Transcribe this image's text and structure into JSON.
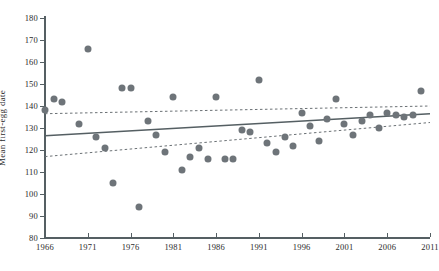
{
  "chart_data": {
    "type": "scatter",
    "title": "",
    "xlabel": "",
    "ylabel": "Mean first-egg date",
    "xlim": [
      1966,
      2011
    ],
    "ylim": [
      80,
      180
    ],
    "grid": false,
    "legend": "none",
    "xticks": [
      1966,
      1971,
      1976,
      1981,
      1986,
      1991,
      1996,
      2001,
      2006,
      2011
    ],
    "yticks": [
      80,
      90,
      100,
      110,
      120,
      130,
      140,
      150,
      160,
      170,
      180
    ],
    "point_color": "#6e7479",
    "line_color": "#555f63",
    "series": [
      {
        "name": "Mean first-egg date",
        "x": [
          1966,
          1967,
          1968,
          1970,
          1971,
          1972,
          1973,
          1974,
          1975,
          1976,
          1977,
          1978,
          1979,
          1980,
          1981,
          1982,
          1983,
          1984,
          1985,
          1986,
          1987,
          1988,
          1989,
          1990,
          1991,
          1992,
          1993,
          1994,
          1995,
          1996,
          1997,
          1998,
          1999,
          2000,
          2001,
          2002,
          2003,
          2004,
          2005,
          2006,
          2007,
          2008,
          2009,
          2010
        ],
        "y": [
          138,
          143,
          142,
          132,
          166,
          126,
          121,
          105,
          148,
          148,
          94,
          133,
          127,
          119,
          144,
          111,
          117,
          121,
          116,
          144,
          116,
          116,
          129,
          128,
          152,
          123,
          119,
          126,
          122,
          137,
          131,
          124,
          134,
          143,
          132,
          127,
          133,
          136,
          130,
          137,
          136,
          135,
          136,
          147
        ]
      }
    ],
    "trend_line": {
      "name": "regression-line",
      "style": "solid",
      "x": [
        1966,
        2011
      ],
      "y": [
        126.5,
        136.5
      ]
    },
    "confidence_band": {
      "name": "confidence-interval",
      "style": "dashed",
      "upper": {
        "x": [
          1966,
          2011
        ],
        "y": [
          136.5,
          140.0
        ]
      },
      "lower": {
        "x": [
          1966,
          2011
        ],
        "y": [
          117.0,
          132.5
        ]
      }
    }
  }
}
